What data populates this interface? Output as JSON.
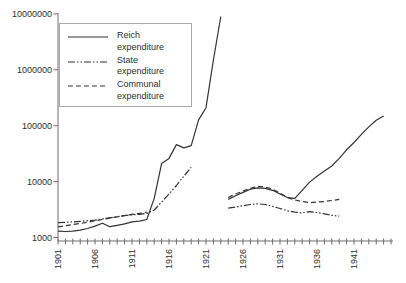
{
  "figure": {
    "background": "#ffffff",
    "axis_color": "#6e6e6e",
    "line_color": "#333333",
    "text_color": "#2e2e2e"
  },
  "legend": {
    "items": [
      {
        "label": "Reich expenditure",
        "style": "solid"
      },
      {
        "label": "State expenditure",
        "style": "dashdotdot"
      },
      {
        "label": "Communal expenditure",
        "style": "dashed"
      }
    ]
  },
  "chart_data": {
    "type": "line",
    "title": "",
    "xlabel": "",
    "ylabel": "",
    "grid": false,
    "legend_position": "top-left-inside",
    "x_axis": {
      "min": 1901,
      "max": 1946,
      "tick_interval": 1,
      "label_interval": 5,
      "tick_labels": [
        "1901",
        "1906",
        "1911",
        "1916",
        "1921",
        "1926",
        "1931",
        "1936",
        "1941"
      ],
      "label_rotation_deg": -90
    },
    "y_axis": {
      "scale": "log",
      "min": 1000,
      "max": 10000000,
      "tick_labels": [
        "1000",
        "10000",
        "100000",
        "1000000",
        "10000000"
      ]
    },
    "series": [
      {
        "name": "Reich expenditure",
        "style": "solid",
        "segments": [
          [
            [
              1901,
              1300
            ],
            [
              1902,
              1280
            ],
            [
              1903,
              1300
            ],
            [
              1904,
              1350
            ],
            [
              1905,
              1450
            ],
            [
              1906,
              1600
            ],
            [
              1907,
              1800
            ],
            [
              1908,
              1560
            ],
            [
              1909,
              1650
            ],
            [
              1910,
              1750
            ],
            [
              1911,
              1900
            ],
            [
              1912,
              1960
            ],
            [
              1913,
              2100
            ],
            [
              1914,
              5000
            ],
            [
              1915,
              21000
            ],
            [
              1916,
              26000
            ],
            [
              1917,
              46000
            ],
            [
              1918,
              40000
            ],
            [
              1919,
              44000
            ],
            [
              1920,
              127000
            ],
            [
              1921,
              210000
            ],
            [
              1922,
              1500000
            ],
            [
              1923,
              9000000
            ]
          ],
          [
            [
              1924,
              4800
            ],
            [
              1925,
              5600
            ],
            [
              1926,
              6400
            ],
            [
              1927,
              7300
            ],
            [
              1928,
              7700
            ],
            [
              1929,
              7600
            ],
            [
              1930,
              7000
            ],
            [
              1931,
              6000
            ],
            [
              1932,
              5200
            ],
            [
              1933,
              5000
            ],
            [
              1934,
              7000
            ],
            [
              1935,
              9800
            ],
            [
              1936,
              12500
            ],
            [
              1937,
              15500
            ],
            [
              1938,
              19000
            ],
            [
              1939,
              26000
            ],
            [
              1940,
              37000
            ],
            [
              1941,
              50000
            ],
            [
              1942,
              70000
            ],
            [
              1943,
              95000
            ],
            [
              1944,
              125000
            ],
            [
              1945,
              150000
            ]
          ]
        ]
      },
      {
        "name": "State expenditure",
        "style": "dashdotdot",
        "segments": [
          [
            [
              1901,
              1850
            ],
            [
              1902,
              1870
            ],
            [
              1903,
              1900
            ],
            [
              1904,
              1950
            ],
            [
              1905,
              2000
            ],
            [
              1906,
              2050
            ],
            [
              1907,
              2150
            ],
            [
              1908,
              2250
            ],
            [
              1909,
              2350
            ],
            [
              1910,
              2450
            ],
            [
              1911,
              2550
            ],
            [
              1912,
              2600
            ],
            [
              1913,
              2700
            ],
            [
              1914,
              3100
            ],
            [
              1915,
              4300
            ],
            [
              1916,
              6000
            ],
            [
              1917,
              8500
            ],
            [
              1918,
              12500
            ],
            [
              1919,
              18000
            ]
          ],
          [
            [
              1924,
              3350
            ],
            [
              1925,
              3500
            ],
            [
              1926,
              3700
            ],
            [
              1927,
              3900
            ],
            [
              1928,
              4000
            ],
            [
              1929,
              3900
            ],
            [
              1930,
              3600
            ],
            [
              1931,
              3300
            ],
            [
              1932,
              3000
            ],
            [
              1933,
              2850
            ],
            [
              1934,
              2750
            ],
            [
              1935,
              2900
            ],
            [
              1936,
              2800
            ],
            [
              1937,
              2650
            ],
            [
              1938,
              2500
            ],
            [
              1939,
              2400
            ]
          ]
        ]
      },
      {
        "name": "Communal expenditure",
        "style": "dashed",
        "segments": [
          [
            [
              1901,
              1550
            ],
            [
              1902,
              1620
            ],
            [
              1903,
              1700
            ],
            [
              1904,
              1780
            ],
            [
              1905,
              1870
            ],
            [
              1906,
              1980
            ],
            [
              1907,
              2100
            ],
            [
              1908,
              2220
            ],
            [
              1909,
              2350
            ],
            [
              1910,
              2480
            ],
            [
              1911,
              2600
            ],
            [
              1912,
              2700
            ],
            [
              1913,
              2850
            ]
          ],
          [
            [
              1924,
              5200
            ],
            [
              1925,
              6000
            ],
            [
              1926,
              6800
            ],
            [
              1927,
              7600
            ],
            [
              1928,
              8200
            ],
            [
              1929,
              8000
            ],
            [
              1930,
              7300
            ],
            [
              1931,
              6200
            ],
            [
              1932,
              5200
            ],
            [
              1933,
              4700
            ],
            [
              1934,
              4400
            ],
            [
              1935,
              4200
            ],
            [
              1936,
              4300
            ],
            [
              1937,
              4400
            ],
            [
              1938,
              4600
            ],
            [
              1939,
              4800
            ]
          ]
        ]
      }
    ]
  }
}
